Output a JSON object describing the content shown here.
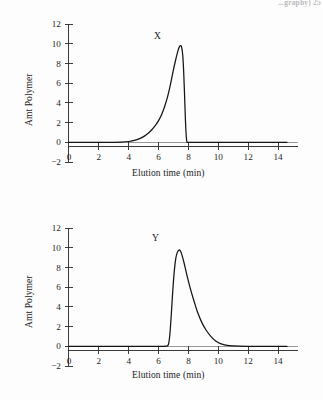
{
  "page": {
    "running_head": "...graphy) 25",
    "background": "#fdfdfd",
    "ink_color": "#141414"
  },
  "chart_data": [
    {
      "type": "line",
      "id": "chart-x",
      "title": "",
      "annotation": "X",
      "xlabel": "Elution time (min)",
      "ylabel": "Amt Polymer",
      "xlim": [
        -0.6,
        14.8
      ],
      "ylim": [
        -2,
        12
      ],
      "xticks": [
        0,
        2,
        4,
        6,
        8,
        10,
        12,
        14
      ],
      "yticks": [
        -2,
        0,
        2,
        4,
        6,
        8,
        10,
        12
      ],
      "xticklabels": [
        "0",
        "2",
        "4",
        "6",
        "8",
        "10",
        "12",
        "14"
      ],
      "yticklabels": [
        "−2",
        "0",
        "2",
        "4",
        "6",
        "8",
        "10",
        "12"
      ],
      "grid": false,
      "legend": "none",
      "description": "Size-exclusion chromatogram of polymer X: long slow leading rise with tailing front edge, sharp apex near 7.5 min, near-vertical trailing drop back to baseline at 7.9 min.",
      "x": [
        0.0,
        0.5,
        1.0,
        1.5,
        2.0,
        2.5,
        3.0,
        3.5,
        4.0,
        4.3,
        4.6,
        4.9,
        5.2,
        5.5,
        5.8,
        6.0,
        6.2,
        6.4,
        6.6,
        6.8,
        7.0,
        7.15,
        7.3,
        7.4,
        7.5,
        7.55,
        7.62,
        7.68,
        7.74,
        7.8,
        7.85,
        7.9,
        8.0,
        8.5,
        9.0,
        10.0,
        11.0,
        12.0,
        13.0,
        14.0,
        14.6
      ],
      "y": [
        0.0,
        0.0,
        0.0,
        0.0,
        0.0,
        0.0,
        0.0,
        0.02,
        0.08,
        0.16,
        0.3,
        0.5,
        0.8,
        1.2,
        1.75,
        2.2,
        2.8,
        3.6,
        4.6,
        5.9,
        7.4,
        8.4,
        9.3,
        9.7,
        9.8,
        9.6,
        8.8,
        7.2,
        4.8,
        2.2,
        0.7,
        0.05,
        0.0,
        0.0,
        0.0,
        0.0,
        0.0,
        0.0,
        0.0,
        0.0,
        0.0
      ],
      "peak": {
        "x": 7.5,
        "y": 9.8
      }
    },
    {
      "type": "line",
      "id": "chart-y",
      "title": "",
      "annotation": "Y",
      "xlabel": "Elution time (min)",
      "ylabel": "Amt Polymer",
      "xlim": [
        -0.6,
        14.8
      ],
      "ylim": [
        -2,
        12
      ],
      "xticks": [
        0,
        2,
        4,
        6,
        8,
        10,
        12,
        14
      ],
      "yticks": [
        -2,
        0,
        2,
        4,
        6,
        8,
        10,
        12
      ],
      "xticklabels": [
        "0",
        "2",
        "4",
        "6",
        "8",
        "10",
        "12",
        "14"
      ],
      "yticklabels": [
        "−2",
        "0",
        "2",
        "4",
        "6",
        "8",
        "10",
        "12"
      ],
      "grid": false,
      "legend": "none",
      "description": "Size-exclusion chromatogram of polymer Y: near-vertical leading edge at 6.7 min, apex near 7.4 min, then long trailing tail decaying to baseline by about 10 min.",
      "x": [
        0.0,
        0.5,
        1.0,
        2.0,
        3.0,
        4.0,
        5.0,
        5.8,
        6.2,
        6.5,
        6.65,
        6.75,
        6.85,
        6.95,
        7.05,
        7.15,
        7.25,
        7.35,
        7.45,
        7.55,
        7.7,
        7.9,
        8.1,
        8.35,
        8.6,
        8.9,
        9.2,
        9.5,
        9.8,
        10.1,
        10.5,
        11.0,
        12.0,
        13.0,
        14.0,
        14.6
      ],
      "y": [
        0.0,
        0.0,
        0.0,
        0.0,
        0.0,
        0.0,
        0.0,
        0.0,
        0.0,
        0.02,
        0.15,
        1.1,
        3.2,
        5.6,
        7.6,
        8.9,
        9.5,
        9.75,
        9.7,
        9.35,
        8.5,
        7.2,
        6.0,
        4.7,
        3.5,
        2.4,
        1.6,
        1.0,
        0.55,
        0.3,
        0.12,
        0.04,
        0.0,
        0.0,
        0.0,
        0.0
      ],
      "peak": {
        "x": 7.4,
        "y": 9.75
      }
    }
  ]
}
